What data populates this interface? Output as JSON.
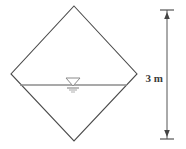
{
  "figure": {
    "shape": {
      "name": "diamond-channel-section",
      "type": "rotated-square",
      "vertices": {
        "top": [
          74,
          6
        ],
        "right": [
          137,
          74
        ],
        "bottom": [
          74,
          141
        ],
        "left": [
          11,
          74
        ]
      },
      "stroke_color": "#4a4a4a",
      "stroke_width": 1.1,
      "fill_color": "#ffffff"
    },
    "water_surface": {
      "name": "water-surface-line",
      "y": 85,
      "x_start": 20,
      "x_end": 127,
      "color": "#8c8c8c",
      "width": 1.6,
      "symbol": {
        "name": "water-table-triangle",
        "center_x": 73,
        "triangle_top_y": 78,
        "triangle_bottom_y": 86,
        "triangle_half_width": 7,
        "color": "#8a8a8a",
        "hatch_lines": [
          {
            "y": 88,
            "half_width": 6
          },
          {
            "y": 90,
            "half_width": 4
          },
          {
            "y": 92,
            "half_width": 2
          }
        ]
      }
    },
    "dimension": {
      "name": "height-dimension",
      "label": "3 m",
      "value": 3,
      "unit": "m",
      "line_x": 167,
      "top_y": 10,
      "bottom_y": 139,
      "tick_half_width": 7,
      "color": "#555555",
      "label_x": 165,
      "label_y": 78,
      "label_anchor": "end"
    }
  }
}
